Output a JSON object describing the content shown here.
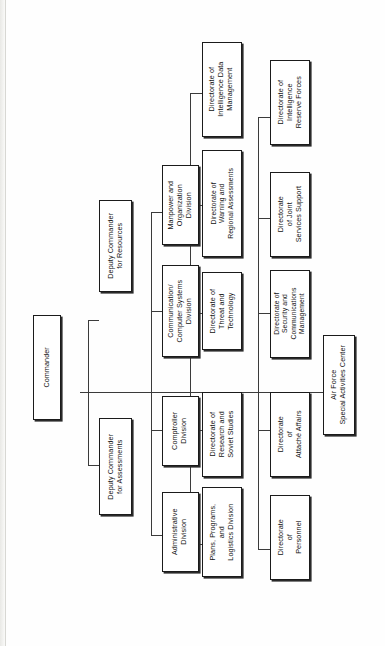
{
  "chart": {
    "type": "org-chart",
    "orientation": "rotated-90-ccw",
    "root": "Commander",
    "nodes": {
      "commander": {
        "label": "Commander"
      },
      "deputy_resources": {
        "label": "Deputy Commander\nfor Resources"
      },
      "deputy_assessments": {
        "label": "Deputy Commander\nfor Assessments"
      },
      "manpower": {
        "label": "Manpower and\nOrganization\nDivision"
      },
      "communication": {
        "label": "Communication/\nComputer Systems\nDivision"
      },
      "comptroller": {
        "label": "Comptroller\nDivision"
      },
      "administrative": {
        "label": "Administrative\nDivision"
      },
      "intel_data": {
        "label": "Directorate of\nIntelligence Data\nManagement"
      },
      "warning": {
        "label": "Directorate of\nWarning and\nRegional Assessments"
      },
      "threat": {
        "label": "Directorate of\nThreat and\nTechnology"
      },
      "research": {
        "label": "Directorate of\nResearch and\nSoviet Studies"
      },
      "plans": {
        "label": "Plans, Programs,\nand\nLogistics Division"
      },
      "intel_reserve": {
        "label": "Directorate of\nIntelligence\nReserve Forces"
      },
      "joint_services": {
        "label": "Directorate\nof Joint\nServices Support"
      },
      "security": {
        "label": "Directorate of\nSecurity and\nCommunications\nManagement"
      },
      "attache": {
        "label": "Directorate\nof\nAttaché Affairs"
      },
      "personnel": {
        "label": "Directorate\nof\nPersonnel"
      },
      "air_force_sac": {
        "label": "Air Force\nSpecial Activities Center"
      }
    },
    "edges": [
      {
        "from": "commander",
        "to": "deputy_resources"
      },
      {
        "from": "commander",
        "to": "deputy_assessments"
      },
      {
        "from": "deputy_resources",
        "to": "manpower"
      },
      {
        "from": "deputy_resources",
        "to": "communication"
      },
      {
        "from": "deputy_assessments",
        "to": "comptroller"
      },
      {
        "from": "deputy_assessments",
        "to": "administrative"
      },
      {
        "from": "deputy_resources",
        "to": "intel_data"
      },
      {
        "from": "deputy_resources",
        "to": "warning"
      },
      {
        "from": "deputy_resources",
        "to": "threat"
      },
      {
        "from": "deputy_assessments",
        "to": "research"
      },
      {
        "from": "deputy_assessments",
        "to": "plans"
      },
      {
        "from": "deputy_resources",
        "to": "intel_reserve"
      },
      {
        "from": "deputy_resources",
        "to": "joint_services"
      },
      {
        "from": "deputy_resources",
        "to": "security"
      },
      {
        "from": "deputy_assessments",
        "to": "attache"
      },
      {
        "from": "deputy_assessments",
        "to": "personnel"
      },
      {
        "from": "commander",
        "to": "air_force_sac"
      }
    ],
    "colors": {
      "box_fill": "#ffffff",
      "box_border": "#1b1b1b",
      "line": "#3b3b3b",
      "text": "#111111",
      "page": "#fefefe"
    }
  }
}
